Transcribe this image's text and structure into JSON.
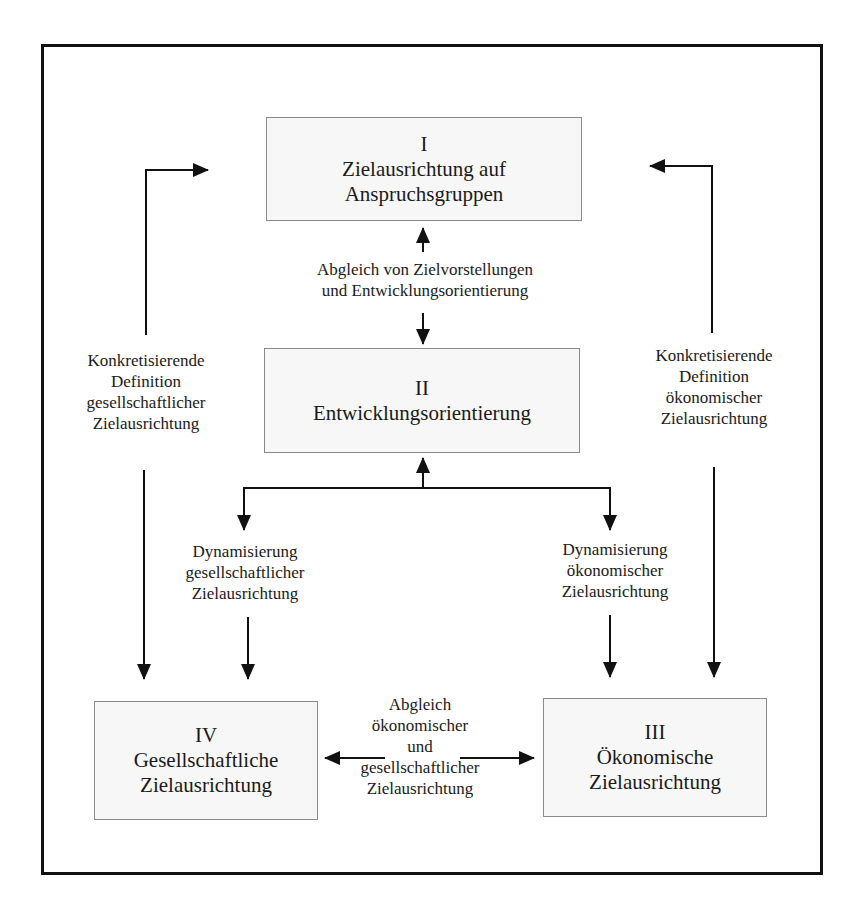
{
  "boxes": {
    "I": {
      "numeral": "I",
      "line1": "Zielausrichtung auf",
      "line2": "Anspruchsgruppen"
    },
    "II": {
      "numeral": "II",
      "line1": "Entwicklungsorientierung"
    },
    "III": {
      "numeral": "III",
      "line1": "Ökonomische",
      "line2": "Zielausrichtung"
    },
    "IV": {
      "numeral": "IV",
      "line1": "Gesellschaftliche",
      "line2": "Zielausrichtung"
    }
  },
  "labels": {
    "abgleich_top": {
      "line1": "Abgleich von Zielvorstellungen",
      "line2": "und Entwicklungsorientierung"
    },
    "left_definition": {
      "line1": "Konkretisierende",
      "line2": "Definition",
      "line3": "gesellschaftlicher",
      "line4": "Zielausrichtung"
    },
    "right_definition": {
      "line1": "Konkretisierende",
      "line2": "Definition",
      "line3": "ökonomischer",
      "line4": "Zielausrichtung"
    },
    "left_dynamisierung": {
      "line1": "Dynamisierung",
      "line2": "gesellschaftlicher",
      "line3": "Zielausrichtung"
    },
    "right_dynamisierung": {
      "line1": "Dynamisierung",
      "line2": "ökonomischer",
      "line3": "Zielausrichtung"
    },
    "abgleich_bottom": {
      "line1": "Abgleich",
      "line2": "ökonomischer",
      "line3": "und",
      "line4": "gesellschaftlicher",
      "line5": "Zielausrichtung"
    }
  },
  "colors": {
    "stroke": "#111111",
    "box_border": "#8a8a8a",
    "box_fill": "#f7f7f7"
  }
}
